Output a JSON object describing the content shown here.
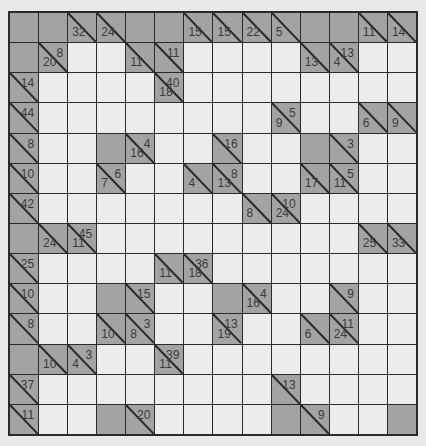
{
  "puzzle": {
    "type": "kakuro",
    "rows": 14,
    "cols": 14,
    "colors": {
      "background": "#e9e9e9",
      "white_cell": "#ececec",
      "block_cell": "#a3a3a3",
      "grid_line": "#2a2a2a",
      "clue_text": "#3a3a3a"
    },
    "grid": [
      [
        "B",
        "B",
        {
          "d": "32"
        },
        {
          "d": "24"
        },
        "B",
        "B",
        {
          "d": "15"
        },
        {
          "d": "15"
        },
        {
          "d": "22"
        },
        {
          "d": "5"
        },
        "B",
        "B",
        {
          "d": "11"
        },
        {
          "d": "14"
        }
      ],
      [
        "B",
        {
          "a": "8",
          "d": "20"
        },
        "W",
        "W",
        {
          "d": "11"
        },
        {
          "a": "11"
        },
        "W",
        "W",
        "W",
        "W",
        {
          "d": "13"
        },
        {
          "a": "13",
          "d": "4"
        },
        "W",
        "W"
      ],
      [
        {
          "a": "14"
        },
        "W",
        "W",
        "W",
        "W",
        {
          "a": "40",
          "d": "18"
        },
        "W",
        "W",
        "W",
        "W",
        "W",
        "W",
        "W",
        "W"
      ],
      [
        {
          "a": "44"
        },
        "W",
        "W",
        "W",
        "W",
        "W",
        "W",
        "W",
        "W",
        {
          "a": "5",
          "d": "9"
        },
        "W",
        "W",
        {
          "d": "6"
        },
        {
          "d": "9"
        }
      ],
      [
        {
          "a": "8"
        },
        "W",
        "W",
        "B",
        {
          "a": "4",
          "d": "16"
        },
        "W",
        "W",
        {
          "a": "16"
        },
        "W",
        "W",
        "B",
        {
          "a": "3"
        },
        "W",
        "W"
      ],
      [
        {
          "a": "10"
        },
        "W",
        "W",
        {
          "a": "6",
          "d": "7"
        },
        "W",
        "W",
        {
          "d": "4"
        },
        {
          "a": "8",
          "d": "13"
        },
        "W",
        "W",
        {
          "d": "17"
        },
        {
          "a": "5",
          "d": "11"
        },
        "W",
        "W"
      ],
      [
        {
          "a": "42"
        },
        "W",
        "W",
        "W",
        "W",
        "W",
        "W",
        "W",
        {
          "d": "8"
        },
        {
          "a": "10",
          "d": "24"
        },
        "W",
        "W",
        "W",
        "W"
      ],
      [
        "B",
        {
          "d": "24"
        },
        {
          "a": "45",
          "d": "11"
        },
        "W",
        "W",
        "W",
        "W",
        "W",
        "W",
        "W",
        "W",
        "W",
        {
          "d": "25"
        },
        {
          "d": "33"
        }
      ],
      [
        {
          "a": "25"
        },
        "W",
        "W",
        "W",
        "W",
        {
          "d": "11"
        },
        {
          "a": "36",
          "d": "18"
        },
        "W",
        "W",
        "W",
        "W",
        "W",
        "W",
        "W"
      ],
      [
        {
          "a": "10"
        },
        "W",
        "W",
        "B",
        {
          "a": "15"
        },
        "W",
        "W",
        "B",
        {
          "a": "4",
          "d": "16"
        },
        "W",
        "W",
        {
          "a": "9"
        },
        "W",
        "W"
      ],
      [
        {
          "a": "8"
        },
        "W",
        "W",
        {
          "d": "10"
        },
        {
          "a": "3",
          "d": "8"
        },
        "W",
        "W",
        {
          "a": "13",
          "d": "19"
        },
        "W",
        "W",
        {
          "d": "6"
        },
        {
          "a": "11",
          "d": "24"
        },
        "W",
        "W"
      ],
      [
        "B",
        {
          "d": "10"
        },
        {
          "a": "3",
          "d": "4"
        },
        "W",
        "W",
        {
          "a": "39",
          "d": "11"
        },
        "W",
        "W",
        "W",
        "W",
        "W",
        "W",
        "W",
        "W"
      ],
      [
        {
          "a": "37"
        },
        "W",
        "W",
        "W",
        "W",
        "W",
        "W",
        "W",
        "W",
        {
          "a": "13"
        },
        "W",
        "W",
        "W",
        "W"
      ],
      [
        {
          "a": "11"
        },
        "W",
        "W",
        "B",
        {
          "a": "20"
        },
        "W",
        "W",
        "W",
        "W",
        "B",
        {
          "a": "9"
        },
        "W",
        "W",
        "B"
      ]
    ]
  }
}
